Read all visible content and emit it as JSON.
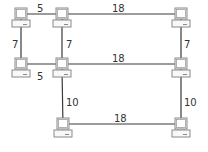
{
  "diagram": {
    "type": "network-graph",
    "nodes": [
      {
        "id": "A",
        "x": 21,
        "y": 18
      },
      {
        "id": "B",
        "x": 62,
        "y": 18
      },
      {
        "id": "C",
        "x": 181,
        "y": 18
      },
      {
        "id": "D",
        "x": 21,
        "y": 68
      },
      {
        "id": "E",
        "x": 62,
        "y": 68
      },
      {
        "id": "F",
        "x": 181,
        "y": 68
      },
      {
        "id": "G",
        "x": 63,
        "y": 128
      },
      {
        "id": "H",
        "x": 181,
        "y": 128
      }
    ],
    "edges": [
      {
        "from": "A",
        "to": "B",
        "weight": "5",
        "label_x": 37,
        "label_y": 12
      },
      {
        "from": "B",
        "to": "C",
        "weight": "18",
        "label_x": 112,
        "label_y": 12
      },
      {
        "from": "A",
        "to": "D",
        "weight": "7",
        "label_x": 12,
        "label_y": 48
      },
      {
        "from": "B",
        "to": "E",
        "weight": "7",
        "label_x": 66,
        "label_y": 48
      },
      {
        "from": "C",
        "to": "F",
        "weight": "7",
        "label_x": 184,
        "label_y": 48
      },
      {
        "from": "D",
        "to": "E",
        "weight": "5",
        "label_x": 37,
        "label_y": 80
      },
      {
        "from": "E",
        "to": "F",
        "weight": "18",
        "label_x": 112,
        "label_y": 62
      },
      {
        "from": "E",
        "to": "G",
        "weight": "10",
        "label_x": 66,
        "label_y": 106
      },
      {
        "from": "F",
        "to": "H",
        "weight": "10",
        "label_x": 184,
        "label_y": 106
      },
      {
        "from": "G",
        "to": "H",
        "weight": "18",
        "label_x": 114,
        "label_y": 122
      }
    ],
    "node_icon": "computer-icon",
    "colors": {
      "edge": "#3a3a3a",
      "label": "#333333",
      "icon_stroke": "#8a8a8a"
    }
  }
}
